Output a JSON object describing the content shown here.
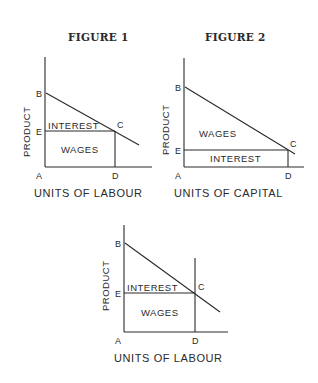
{
  "figures": [
    {
      "title": "FIGURE 1",
      "ylabel": "PRODUCT",
      "xlabel": "UNITS OF LABOUR",
      "points": {
        "A": "A",
        "B": "B",
        "C": "C",
        "D": "D",
        "E": "E"
      },
      "regions": {
        "upper": "INTEREST",
        "lower": "WAGES"
      }
    },
    {
      "title": "FIGURE 2",
      "ylabel": "PRODUCT",
      "xlabel": "UNITS OF CAPITAL",
      "points": {
        "A": "A",
        "B": "B",
        "C": "C",
        "D": "D",
        "E": "E"
      },
      "regions": {
        "upper": "WAGES",
        "lower": "INTEREST"
      }
    },
    {
      "title": "",
      "ylabel": "PRODUCT",
      "xlabel": "UNITS OF LABOUR",
      "points": {
        "A": "A",
        "B": "B",
        "C": "C",
        "D": "D",
        "E": "E"
      },
      "regions": {
        "upper": "INTEREST",
        "lower": "WAGES"
      }
    }
  ],
  "colors": {
    "ink": "#2a2a2a",
    "background": "#ffffff"
  }
}
